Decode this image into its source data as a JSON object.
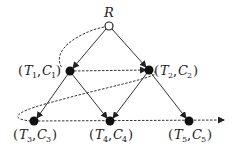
{
  "diagram": {
    "root": {
      "label": "R",
      "x": 109,
      "y": 26
    },
    "nodes": [
      {
        "id": "n1",
        "T": "T",
        "Ti": "1",
        "C": "C",
        "Ci": "1",
        "x": 70,
        "y": 71
      },
      {
        "id": "n2",
        "T": "T",
        "Ti": "2",
        "C": "C",
        "Ci": "2",
        "x": 149,
        "y": 70
      },
      {
        "id": "n3",
        "T": "T",
        "Ti": "3",
        "C": "C",
        "Ci": "3",
        "x": 34,
        "y": 121
      },
      {
        "id": "n4",
        "T": "T",
        "Ti": "4",
        "C": "C",
        "Ci": "4",
        "x": 110,
        "y": 121
      },
      {
        "id": "n5",
        "T": "T",
        "Ti": "5",
        "C": "C",
        "Ci": "5",
        "x": 189,
        "y": 121
      }
    ],
    "edges": [
      [
        "R",
        "n1"
      ],
      [
        "R",
        "n2"
      ],
      [
        "n1",
        "n3"
      ],
      [
        "n1",
        "n4"
      ],
      [
        "n2",
        "n4"
      ],
      [
        "n2",
        "n5"
      ]
    ],
    "traversal": "dashed path R → (T1,C1) → (T2,C2) → (T3,C3) → (T4,C4) → (T5,C5) →",
    "colors": {
      "stroke": "#222222",
      "node_fill": "#111111"
    }
  }
}
